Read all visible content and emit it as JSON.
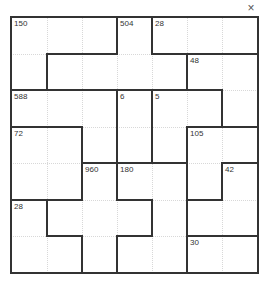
{
  "window": {
    "title": "",
    "close_label": "×"
  },
  "puzzle": {
    "type": "product-cage",
    "size": 7,
    "cages": [
      {
        "clue": "150",
        "cells": [
          [
            0,
            0
          ],
          [
            0,
            1
          ],
          [
            0,
            2
          ],
          [
            1,
            0
          ]
        ]
      },
      {
        "clue": "504",
        "cells": [
          [
            0,
            3
          ],
          [
            1,
            1
          ],
          [
            1,
            2
          ],
          [
            1,
            3
          ],
          [
            1,
            4
          ]
        ]
      },
      {
        "clue": "28",
        "cells": [
          [
            0,
            4
          ],
          [
            0,
            5
          ],
          [
            0,
            6
          ]
        ]
      },
      {
        "clue": "48",
        "cells": [
          [
            1,
            5
          ],
          [
            1,
            6
          ],
          [
            2,
            6
          ]
        ]
      },
      {
        "clue": "588",
        "cells": [
          [
            2,
            0
          ],
          [
            2,
            1
          ],
          [
            2,
            2
          ],
          [
            3,
            2
          ]
        ]
      },
      {
        "clue": "6",
        "cells": [
          [
            2,
            3
          ],
          [
            3,
            3
          ]
        ]
      },
      {
        "clue": "5",
        "cells": [
          [
            2,
            4
          ],
          [
            2,
            5
          ],
          [
            3,
            4
          ]
        ]
      },
      {
        "clue": "72",
        "cells": [
          [
            3,
            0
          ],
          [
            3,
            1
          ],
          [
            4,
            0
          ],
          [
            4,
            1
          ]
        ]
      },
      {
        "clue": "105",
        "cells": [
          [
            3,
            5
          ],
          [
            3,
            6
          ],
          [
            4,
            5
          ]
        ]
      },
      {
        "clue": "960",
        "cells": [
          [
            4,
            2
          ],
          [
            5,
            1
          ],
          [
            5,
            2
          ],
          [
            5,
            3
          ],
          [
            6,
            2
          ]
        ]
      },
      {
        "clue": "180",
        "cells": [
          [
            4,
            3
          ],
          [
            4,
            4
          ],
          [
            5,
            4
          ],
          [
            6,
            3
          ],
          [
            6,
            4
          ]
        ]
      },
      {
        "clue": "42",
        "cells": [
          [
            4,
            6
          ],
          [
            5,
            5
          ],
          [
            5,
            6
          ]
        ]
      },
      {
        "clue": "28",
        "cells": [
          [
            5,
            0
          ],
          [
            6,
            0
          ],
          [
            6,
            1
          ]
        ]
      },
      {
        "clue": "30",
        "cells": [
          [
            6,
            5
          ],
          [
            6,
            6
          ]
        ]
      }
    ],
    "values": [
      [
        "",
        "",
        "",
        "",
        "",
        "",
        ""
      ],
      [
        "",
        "",
        "",
        "",
        "",
        "",
        ""
      ],
      [
        "",
        "",
        "",
        "",
        "",
        "",
        ""
      ],
      [
        "",
        "",
        "",
        "",
        "",
        "",
        ""
      ],
      [
        "",
        "",
        "",
        "",
        "",
        "",
        ""
      ],
      [
        "",
        "",
        "",
        "",
        "",
        "",
        ""
      ],
      [
        "",
        "",
        "",
        "",
        "",
        "",
        ""
      ]
    ]
  },
  "colors": {
    "border": "#333333",
    "gridline": "#d8d8d8",
    "background": "#ffffff"
  }
}
